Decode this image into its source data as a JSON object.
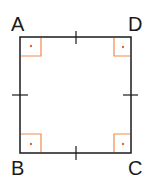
{
  "figure": {
    "type": "square",
    "vertices": {
      "A": {
        "label": "A",
        "x": 20,
        "y": 37
      },
      "D": {
        "label": "D",
        "x": 131,
        "y": 37
      },
      "B": {
        "label": "B",
        "x": 20,
        "y": 153
      },
      "C": {
        "label": "C",
        "x": 131,
        "y": 153
      }
    },
    "right_angle_marks": [
      "A",
      "B",
      "C",
      "D"
    ],
    "equal_side_ticks": [
      "AD",
      "DC",
      "CB",
      "BA"
    ],
    "colors": {
      "stroke": "#1a1a1a",
      "right_angle": "#f08a4b"
    }
  }
}
